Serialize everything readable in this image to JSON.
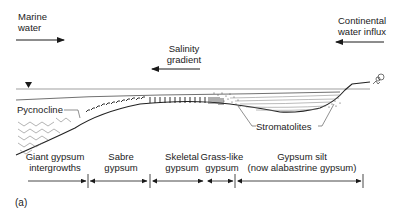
{
  "figure_label": "(a)",
  "flows": {
    "marine_water": {
      "line1": "Marine",
      "line2": "water",
      "direction": "right"
    },
    "salinity_gradient": {
      "line1": "Salinity",
      "line2": "gradient",
      "direction": "left"
    },
    "continental_influx": {
      "line1": "Continental",
      "line2": "water influx",
      "direction": "left"
    }
  },
  "water_level_marker": "water-level-triangle",
  "callouts": {
    "pycnocline": "Pycnocline",
    "stromatolites": "Stromatolites"
  },
  "zones": [
    {
      "line1": "Giant gypsum",
      "line2": "intergrowths"
    },
    {
      "line1": "Sabre",
      "line2": "gypsum"
    },
    {
      "line1": "Skeletal",
      "line2": "gypsum"
    },
    {
      "line1": "Grass-like",
      "line2": "gypsum"
    },
    {
      "line1": "Gypsum silt",
      "line2": "(now alabastrine gypsum)"
    }
  ],
  "colors": {
    "ink": "#1a1a1a",
    "background": "#ffffff"
  }
}
